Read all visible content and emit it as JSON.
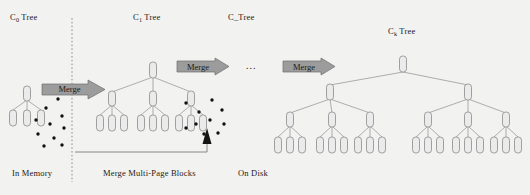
{
  "figure": {
    "type": "lsm-tree-merge-diagram",
    "background_color": "#f2f2f0",
    "node_fill": "#ebebeb",
    "node_stroke": "#8a8a8a",
    "line_color": "#9a9a9a",
    "arrow_fill": "#9c9c9c",
    "arrow_stroke": "#6a6a6a",
    "text_color": "#1a1a1a",
    "dot_color": "#111111"
  },
  "tree_labels": [
    {
      "id": "c0",
      "prefix": "C",
      "sub": "0",
      "suffix": " Tree",
      "x": 10,
      "y": 12
    },
    {
      "id": "c1",
      "prefix": "C",
      "sub": "1",
      "suffix": " Tree",
      "x": 133,
      "y": 12
    },
    {
      "id": "cdots",
      "prefix": "C",
      "sub": "",
      "suffix": "_Tree",
      "x": 228,
      "y": 12
    },
    {
      "id": "ck",
      "prefix": "C",
      "sub": "k",
      "suffix": " Tree",
      "x": 388,
      "y": 26
    }
  ],
  "merge_arrows": [
    {
      "id": "merge-1",
      "label": "Merge",
      "x": 42,
      "y": 80,
      "w": 63,
      "h": 19
    },
    {
      "id": "merge-2",
      "label": "Merge",
      "x": 177,
      "y": 58,
      "w": 52,
      "h": 17
    },
    {
      "id": "merge-3",
      "label": "Merge",
      "x": 283,
      "y": 58,
      "w": 52,
      "h": 17
    }
  ],
  "ellipsis": {
    "label": "...",
    "x": 246,
    "y": 62
  },
  "bottom_labels": [
    {
      "id": "in-memory",
      "text": "In Memory",
      "x": 12,
      "y": 170
    },
    {
      "id": "merge-blocks",
      "text": "Merge Multi-Page Blocks",
      "x": 103,
      "y": 170
    },
    {
      "id": "on-disk",
      "text": "On Disk",
      "x": 238,
      "y": 170
    }
  ],
  "divider": {
    "id": "memory-disk-divider",
    "x": 72,
    "y1": 18,
    "y2": 182
  },
  "feedback_line": {
    "id": "feedback-arrow",
    "x_from": 75,
    "x_to": 207,
    "y": 152,
    "arrow_tip_y": 130
  },
  "trees": {
    "c0": {
      "root": {
        "x": 27,
        "y": 88
      },
      "levels": [
        [
          {
            "x": 13,
            "y": 110
          },
          {
            "x": 27,
            "y": 110
          },
          {
            "x": 41,
            "y": 110
          }
        ]
      ]
    },
    "c1": {
      "root": {
        "x": 153,
        "y": 63
      },
      "mid": [
        {
          "x": 112,
          "y": 92
        },
        {
          "x": 153,
          "y": 92
        },
        {
          "x": 191,
          "y": 92
        }
      ],
      "leaves": [
        {
          "x": 100,
          "y": 115
        },
        {
          "x": 112,
          "y": 115
        },
        {
          "x": 124,
          "y": 115
        },
        {
          "x": 141,
          "y": 115
        },
        {
          "x": 153,
          "y": 115
        },
        {
          "x": 165,
          "y": 115
        },
        {
          "x": 179,
          "y": 115
        },
        {
          "x": 191,
          "y": 115
        },
        {
          "x": 203,
          "y": 115
        }
      ]
    },
    "ck": {
      "root": {
        "x": 403,
        "y": 58
      },
      "level2": [
        {
          "x": 330,
          "y": 85
        },
        {
          "x": 468,
          "y": 85
        }
      ],
      "level3": [
        {
          "x": 290,
          "y": 113
        },
        {
          "x": 332,
          "y": 113
        },
        {
          "x": 370,
          "y": 113
        },
        {
          "x": 428,
          "y": 113
        },
        {
          "x": 468,
          "y": 113
        },
        {
          "x": 506,
          "y": 113
        }
      ],
      "leaf_groups": [
        [
          {
            "x": 278,
            "y": 137
          },
          {
            "x": 290,
            "y": 137
          },
          {
            "x": 302,
            "y": 137
          }
        ],
        [
          {
            "x": 320,
            "y": 137
          },
          {
            "x": 332,
            "y": 137
          },
          {
            "x": 344,
            "y": 137
          }
        ],
        [
          {
            "x": 358,
            "y": 137
          },
          {
            "x": 370,
            "y": 137
          },
          {
            "x": 382,
            "y": 137
          }
        ],
        [
          {
            "x": 416,
            "y": 137
          },
          {
            "x": 428,
            "y": 137
          },
          {
            "x": 440,
            "y": 137
          }
        ],
        [
          {
            "x": 456,
            "y": 137
          },
          {
            "x": 468,
            "y": 137
          },
          {
            "x": 480,
            "y": 137
          }
        ],
        [
          {
            "x": 494,
            "y": 137
          },
          {
            "x": 506,
            "y": 137
          },
          {
            "x": 518,
            "y": 137
          }
        ]
      ]
    }
  },
  "scatter_dots": [
    {
      "x": 46,
      "y": 108
    },
    {
      "x": 58,
      "y": 99
    },
    {
      "x": 36,
      "y": 120
    },
    {
      "x": 50,
      "y": 124
    },
    {
      "x": 62,
      "y": 116
    },
    {
      "x": 64,
      "y": 128
    },
    {
      "x": 38,
      "y": 134
    },
    {
      "x": 54,
      "y": 138
    },
    {
      "x": 44,
      "y": 146
    },
    {
      "x": 62,
      "y": 145
    },
    {
      "x": 186,
      "y": 103
    },
    {
      "x": 199,
      "y": 112
    },
    {
      "x": 212,
      "y": 100
    },
    {
      "x": 222,
      "y": 110
    },
    {
      "x": 196,
      "y": 124
    },
    {
      "x": 210,
      "y": 120
    },
    {
      "x": 224,
      "y": 124
    },
    {
      "x": 186,
      "y": 128
    },
    {
      "x": 204,
      "y": 134
    },
    {
      "x": 218,
      "y": 133
    }
  ]
}
